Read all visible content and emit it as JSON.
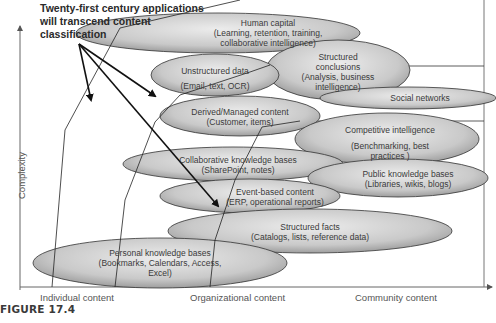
{
  "title": {
    "line1": "Twenty-first century  applications",
    "line2": "will transcend content",
    "line3": "classification"
  },
  "axes": {
    "y_label": "Complexity",
    "x_labels": [
      "Individual content",
      "Organizational  content",
      "Community content"
    ]
  },
  "figure_caption": "FIGURE 17.4",
  "ellipses": [
    {
      "id": "human-capital",
      "line1": "Human capital",
      "line2": "(Learning, retention, training,",
      "line3": "collaborative intelligence)"
    },
    {
      "id": "structured-conclusions",
      "line1": "Structured",
      "line2": "conclusions",
      "line3": "(Analysis, business",
      "line4": "intelligence)"
    },
    {
      "id": "unstructured-data",
      "line1": "Unstructured data",
      "line2": "(Email, text, OCR)"
    },
    {
      "id": "social-networks",
      "line1": "Social networks"
    },
    {
      "id": "derived-managed",
      "line1": "Derived/Managed content",
      "line2": "(Customer, items)"
    },
    {
      "id": "competitive-intelligence",
      "line1": "Competitive intelligence",
      "line2": "(Benchmarking, best",
      "line3": "practices )"
    },
    {
      "id": "collaborative-kb",
      "line1": "Collaborative knowledge bases",
      "line2": "(SharePoint, notes)"
    },
    {
      "id": "public-kb",
      "line1": "Public knowledge bases",
      "line2": "(Libraries, wikis, blogs)"
    },
    {
      "id": "event-based",
      "line1": "Event-based content",
      "line2": "(ERP, operational reports)"
    },
    {
      "id": "structured-facts",
      "line1": "Structured facts",
      "line2": "(Catalogs, lists, reference data)"
    },
    {
      "id": "personal-kb",
      "line1": "Personal knowledge bases",
      "line2": "(Bookmarks, Calendars, Access,",
      "line3": "Excel)"
    }
  ],
  "colors": {
    "ellipse_fill_light": "#e6e6e6",
    "ellipse_fill_dark": "#a8a8a8",
    "ellipse_stroke": "#333333",
    "line": "#222222",
    "text": "#3a3a3a"
  }
}
